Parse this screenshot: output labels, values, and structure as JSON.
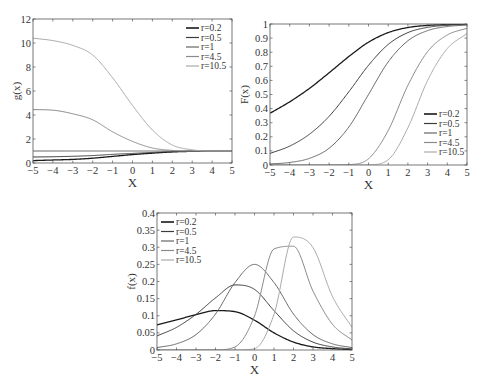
{
  "colors": {
    "r=0.2": "#1a1a1a",
    "r=0.5": "#3c3c3c",
    "r=1": "#666666",
    "r=4.5": "#8a8a8a",
    "r=10.5": "#aaaaaa",
    "axis": "#555555"
  },
  "chart_data": [
    {
      "id": "g",
      "type": "line",
      "title": "",
      "xlabel": "X",
      "ylabel": "g(x)",
      "xlim": [
        -5,
        5
      ],
      "ylim": [
        0,
        12
      ],
      "xticks": [
        -5,
        -4,
        -3,
        -2,
        -1,
        0,
        1,
        2,
        3,
        4,
        5
      ],
      "yticks": [
        0,
        2,
        4,
        6,
        8,
        10,
        12
      ],
      "grid": false,
      "legend_position": "upper right",
      "x": [
        -5,
        -4,
        -3,
        -2,
        -1,
        0,
        1,
        2,
        3,
        4,
        5
      ],
      "series": [
        {
          "name": "r=0.2",
          "values": [
            0.2,
            0.25,
            0.3,
            0.4,
            0.55,
            0.7,
            0.82,
            0.92,
            0.97,
            0.99,
            1.0
          ]
        },
        {
          "name": "r=0.5",
          "values": [
            0.5,
            0.52,
            0.56,
            0.62,
            0.72,
            0.8,
            0.88,
            0.95,
            0.98,
            0.99,
            1.0
          ]
        },
        {
          "name": "r=1",
          "values": [
            1.0,
            1.0,
            1.0,
            1.0,
            1.0,
            1.0,
            1.0,
            1.0,
            1.0,
            1.0,
            1.0
          ]
        },
        {
          "name": "r=4.5",
          "values": [
            4.45,
            4.4,
            4.1,
            3.6,
            2.6,
            1.8,
            1.25,
            1.05,
            1.0,
            1.0,
            1.0
          ]
        },
        {
          "name": "r=10.5",
          "values": [
            10.4,
            10.2,
            9.8,
            9.0,
            7.1,
            4.8,
            2.75,
            1.5,
            1.1,
            1.0,
            1.0
          ]
        }
      ]
    },
    {
      "id": "F",
      "type": "line",
      "title": "",
      "xlabel": "X",
      "ylabel": "F(x)",
      "xlim": [
        -5,
        5
      ],
      "ylim": [
        0,
        1
      ],
      "xticks": [
        -5,
        -4,
        -3,
        -2,
        -1,
        0,
        1,
        2,
        3,
        4,
        5
      ],
      "yticks": [
        0,
        0.1,
        0.2,
        0.3,
        0.4,
        0.5,
        0.6,
        0.7,
        0.8,
        0.9,
        1
      ],
      "grid": false,
      "legend_position": "lower right",
      "x": [
        -5,
        -4,
        -3,
        -2,
        -1,
        0,
        1,
        2,
        3,
        4,
        5
      ],
      "series": [
        {
          "name": "r=0.2",
          "values": [
            0.367,
            0.448,
            0.543,
            0.654,
            0.769,
            0.871,
            0.939,
            0.975,
            0.99,
            0.996,
            0.999
          ]
        },
        {
          "name": "r=0.5",
          "values": [
            0.082,
            0.134,
            0.218,
            0.345,
            0.519,
            0.707,
            0.855,
            0.939,
            0.976,
            0.991,
            0.997
          ]
        },
        {
          "name": "r=1",
          "values": [
            0.007,
            0.018,
            0.047,
            0.119,
            0.269,
            0.5,
            0.731,
            0.881,
            0.953,
            0.982,
            0.993
          ]
        },
        {
          "name": "r=4.5",
          "values": [
            0,
            0,
            0,
            0.0001,
            0.003,
            0.044,
            0.244,
            0.565,
            0.804,
            0.922,
            0.97
          ]
        },
        {
          "name": "r=10.5",
          "values": [
            0,
            0,
            0,
            0,
            0,
            0.001,
            0.037,
            0.264,
            0.6,
            0.826,
            0.932
          ]
        }
      ]
    },
    {
      "id": "f",
      "type": "line",
      "title": "",
      "xlabel": "X",
      "ylabel": "f(x)",
      "xlim": [
        -5,
        5
      ],
      "ylim": [
        0,
        0.4
      ],
      "xticks": [
        -5,
        -4,
        -3,
        -2,
        -1,
        0,
        1,
        2,
        3,
        4,
        5
      ],
      "yticks": [
        0,
        0.05,
        0.1,
        0.15,
        0.2,
        0.25,
        0.3,
        0.35,
        0.4
      ],
      "grid": false,
      "legend_position": "upper left",
      "x": [
        -5,
        -4,
        -3,
        -2,
        -1,
        0,
        1,
        2,
        3,
        4,
        5
      ],
      "series": [
        {
          "name": "r=0.2",
          "values": [
            0.073,
            0.088,
            0.103,
            0.115,
            0.112,
            0.087,
            0.05,
            0.023,
            0.009,
            0.004,
            0.001
          ]
        },
        {
          "name": "r=0.5",
          "values": [
            0.041,
            0.066,
            0.104,
            0.152,
            0.19,
            0.177,
            0.115,
            0.056,
            0.023,
            0.009,
            0.003
          ]
        },
        {
          "name": "r=1",
          "values": [
            0.007,
            0.018,
            0.045,
            0.105,
            0.197,
            0.25,
            0.197,
            0.105,
            0.045,
            0.018,
            0.007
          ]
        },
        {
          "name": "r=4.5",
          "values": [
            0,
            0,
            0,
            0.0003,
            0.009,
            0.099,
            0.295,
            0.303,
            0.172,
            0.075,
            0.029
          ]
        },
        {
          "name": "r=10.5",
          "values": [
            0,
            0,
            0,
            0,
            0,
            0.004,
            0.104,
            0.33,
            0.299,
            0.156,
            0.066
          ]
        }
      ]
    }
  ]
}
